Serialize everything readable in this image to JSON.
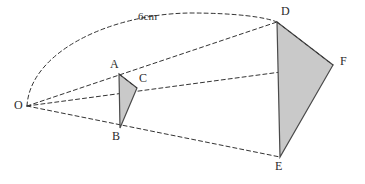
{
  "figure": {
    "width": 365,
    "height": 184,
    "background_color": "#ffffff"
  },
  "style": {
    "stroke_color": "#333333",
    "outline_color": "#4a4a4a",
    "fill_color": "#c9c9c9",
    "label_color": "#2b2b2b",
    "dash_pattern": "4 3",
    "stroke_width": 1
  },
  "points": {
    "O": {
      "label": "O",
      "x": 27,
      "y": 106,
      "label_x": 14,
      "label_y": 101
    },
    "A": {
      "label": "A",
      "x": 119,
      "y": 74,
      "label_x": 111,
      "label_y": 60
    },
    "B": {
      "label": "B",
      "x": 120,
      "y": 128,
      "label_x": 113,
      "label_y": 131
    },
    "C": {
      "label": "C",
      "x": 137,
      "y": 88,
      "label_x": 140,
      "label_y": 74
    },
    "D": {
      "label": "D",
      "x": 277,
      "y": 22,
      "label_x": 281,
      "label_y": 8
    },
    "E": {
      "label": "E",
      "x": 280,
      "y": 157,
      "label_x": 276,
      "label_y": 160
    },
    "F": {
      "label": "F",
      "x": 333,
      "y": 65,
      "label_x": 340,
      "label_y": 57
    }
  },
  "shapes": {
    "small_triangle": {
      "name": "triangle-ABC",
      "vertices": "119,74 137,88 120,128",
      "vertex_labels": [
        "A",
        "C",
        "B"
      ]
    },
    "large_triangle": {
      "name": "triangle-DEF",
      "vertices": "277,22 333,65 280,157",
      "vertex_labels": [
        "D",
        "F",
        "E"
      ]
    }
  },
  "rays": [
    {
      "name": "ray-O-A-D",
      "from": "O",
      "through": "A",
      "to": "D",
      "path": "M27,106 L277,22"
    },
    {
      "name": "ray-O-C-F",
      "from": "O",
      "through": "C",
      "to": "F",
      "path": "M27,106 L333,65"
    },
    {
      "name": "ray-O-B-E",
      "from": "O",
      "through": "B",
      "to": "E",
      "path": "M27,106 L280,157"
    }
  ],
  "internal_segments": [
    {
      "name": "segment-A-C",
      "path": "M119,74 L137,88"
    },
    {
      "name": "segment-D-F",
      "path": "M277,22 L333,65"
    }
  ],
  "arc": {
    "name": "arc-O-to-D",
    "from": "O",
    "to": "D",
    "path": "M27,106 C30,52 110,14 190,13 C235,13 265,17 277,22",
    "measure_label": "6cm",
    "measure_label_x": 138,
    "measure_label_y": 12
  }
}
